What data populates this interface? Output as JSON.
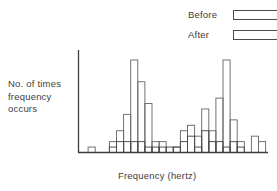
{
  "legend": {
    "items": [
      {
        "label": "Before",
        "swatch": "legend-swatch-before",
        "fill": "#ffffff",
        "stroke": "#4a4a4a"
      },
      {
        "label": "After",
        "swatch": "legend-swatch-after",
        "fill": "#ffffff",
        "stroke": "#4a4a4a"
      }
    ]
  },
  "axes": {
    "ylabel": "No. of times frequency occurs",
    "ylabel_lines": [
      "No. of times",
      "frequency",
      "occurs"
    ],
    "xlabel": "Frequency (hertz)"
  },
  "colors": {
    "axis": "#3d3d3d",
    "bar_stroke": "#6b6b6b",
    "bar_stroke_dark": "#4a4a4a",
    "bar_fill": "#ffffff",
    "text": "#3d3d3d",
    "background": "#ffffff"
  },
  "chart_data": {
    "type": "bar",
    "title": "",
    "xlabel": "Frequency (hertz)",
    "ylabel": "No. of times frequency occurs",
    "grid": false,
    "legend_position": "top-right",
    "axis_ticks_shown": false,
    "ylim": [
      0,
      20
    ],
    "xlim": [
      0,
      26
    ],
    "categories": [
      "1",
      "2",
      "3",
      "4",
      "5",
      "6",
      "7",
      "8",
      "9",
      "10",
      "11",
      "12",
      "13",
      "14",
      "15",
      "16",
      "17",
      "18",
      "19",
      "20",
      "21",
      "22",
      "23",
      "24",
      "25",
      "26"
    ],
    "series": [
      {
        "name": "Before",
        "values": [
          0,
          1,
          0,
          0,
          2,
          4,
          7,
          17,
          13,
          9,
          2,
          2,
          0,
          1,
          4,
          5,
          3,
          8,
          4,
          10,
          17,
          6,
          2,
          0,
          3,
          2
        ]
      },
      {
        "name": "After",
        "values": [
          0,
          0,
          0,
          0,
          1,
          2,
          2,
          2,
          2,
          1,
          1,
          1,
          1,
          1,
          2,
          3,
          1,
          4,
          2,
          2,
          1,
          2,
          1,
          0,
          0,
          0
        ]
      }
    ]
  }
}
